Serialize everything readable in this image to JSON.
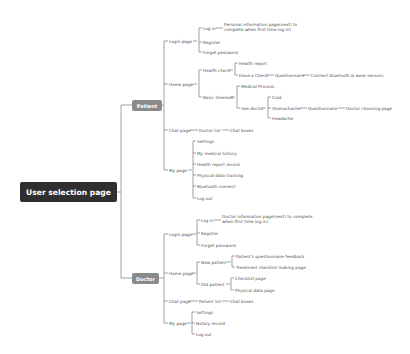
{
  "root": {
    "label": "User selection page"
  },
  "patient": {
    "label": "Patient",
    "login": {
      "label": "Login page",
      "log_in": "Log in",
      "log_in_note_1": "Personal information page(next) to",
      "log_in_note_2": "complete when first time log in)",
      "register": "Register",
      "forgot": "Forget password"
    },
    "home": {
      "label": "Home page",
      "health_check": "Health check",
      "health_report": "Health report",
      "have_a_check": "Have a Check",
      "questionnaire": "Questionnaire",
      "connect": "Connect bluetooth & wear sensors",
      "basic_illnesses": "Basic illnesses",
      "medical_process": "Medical Process",
      "see_doctor": "See doctor",
      "cold": "Cold",
      "stomachache": "Stomachache",
      "questionnaire2": "Questionnaire",
      "doctor_choosing": "Doctor choosing page",
      "headache": "Headache"
    },
    "chat": {
      "label": "Chat page",
      "list": "Doctor list",
      "box": "Chat boxes"
    },
    "my": {
      "label": "My page",
      "items": [
        "Settings",
        "My medical history",
        "Health report record",
        "Physical data tracking",
        "Bluetooth connect",
        "Log out"
      ]
    }
  },
  "doctor": {
    "label": "Doctor",
    "login": {
      "label": "Login page",
      "log_in": "Log in",
      "log_in_note_1": "Doctor information page(next) to complete",
      "log_in_note_2": "when first time log in)",
      "register": "Register",
      "forgot": "Forget password"
    },
    "home": {
      "label": "Home page",
      "new_patient": "New patient",
      "feedback": "Patient's questionnaire feedback",
      "treatment": "Treatment checklist making page",
      "old_patient": "Old patient",
      "checklist": "Checklist page",
      "physical": "Physical data page"
    },
    "chat": {
      "label": "Chat page",
      "list": "Patient list",
      "box": "Chat boxes"
    },
    "my": {
      "label": "My page",
      "items": [
        "Settings",
        "Notary record",
        "Log out"
      ]
    }
  }
}
